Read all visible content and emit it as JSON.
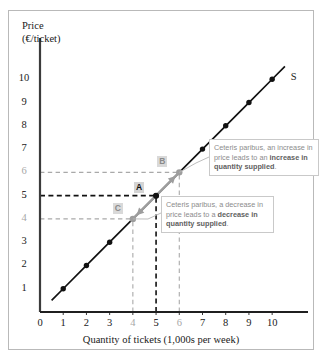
{
  "chart_data": {
    "type": "line",
    "title": "",
    "xlabel": "Quantity of tickets (1,000s per week)",
    "ylabel_line1": "Price",
    "ylabel_line2": "(€/ticket)",
    "xlim": [
      0,
      11.2
    ],
    "ylim": [
      0,
      11.0
    ],
    "xticks": [
      0,
      1,
      2,
      3,
      4,
      5,
      6,
      7,
      8,
      9,
      10
    ],
    "yticks": [
      1,
      2,
      3,
      4,
      5,
      6,
      7,
      8,
      9,
      10
    ],
    "muted_xticks": [
      4,
      6
    ],
    "muted_yticks": [
      4,
      6
    ],
    "bold_xticks": [
      5
    ],
    "bold_yticks": [
      5
    ],
    "grid": false,
    "legend": "none",
    "series": [
      {
        "name": "S",
        "label": "S",
        "color": "#111111",
        "x": [
          0.5,
          1.0,
          2.0,
          3.0,
          4.0,
          5.0,
          6.0,
          7.0,
          8.0,
          9.0,
          10.0,
          10.55
        ],
        "y": [
          0.5,
          1.0,
          2.0,
          3.0,
          4.0,
          5.0,
          6.0,
          7.0,
          8.0,
          9.0,
          10.0,
          10.55
        ],
        "markers_x": [
          1,
          2,
          3,
          5,
          7,
          8,
          9,
          10
        ],
        "markers_y": [
          1,
          2,
          3,
          5,
          7,
          8,
          9,
          10
        ]
      }
    ],
    "points": [
      {
        "id": "A",
        "label": "A",
        "x": 5,
        "y": 5,
        "style": "black",
        "label_dx": -22,
        "label_dy": -14
      },
      {
        "id": "B",
        "label": "B",
        "x": 6,
        "y": 6,
        "style": "gray",
        "label_dx": -22,
        "label_dy": -16
      },
      {
        "id": "C",
        "label": "C",
        "x": 4,
        "y": 4,
        "style": "gray",
        "label_dx": -20,
        "label_dy": -16
      }
    ],
    "guides": [
      {
        "axis": "y",
        "value": 6,
        "color": "#a9a9a9",
        "from_x": 0,
        "to_x": 6
      },
      {
        "axis": "y",
        "value": 5,
        "color": "#111111",
        "from_x": 0,
        "to_x": 5
      },
      {
        "axis": "y",
        "value": 4,
        "color": "#a9a9a9",
        "from_x": 0,
        "to_x": 4
      },
      {
        "axis": "x",
        "value": 6,
        "color": "#a9a9a9",
        "from_y": 0,
        "to_y": 6
      },
      {
        "axis": "x",
        "value": 5,
        "color": "#111111",
        "from_y": 0,
        "to_y": 5
      },
      {
        "axis": "x",
        "value": 4,
        "color": "#a9a9a9",
        "from_y": 0,
        "to_y": 4
      }
    ],
    "arrows": [
      {
        "id": "up",
        "from_x": 5,
        "from_y": 5,
        "to_x": 6,
        "to_y": 6,
        "color": "#9d9d9d"
      },
      {
        "id": "down",
        "from_x": 5,
        "from_y": 5,
        "to_x": 4,
        "to_y": 4,
        "color": "#9d9d9d"
      }
    ]
  },
  "annotations": {
    "increase": {
      "lead": "Ceteris paribus, an increase in price leads to an ",
      "bold": "increase in quantity supplied",
      "tail": "."
    },
    "decrease": {
      "lead": "Ceteris paribus, a decrease in price leads to a ",
      "bold": "decrease in quantity supplied",
      "tail": "."
    }
  }
}
